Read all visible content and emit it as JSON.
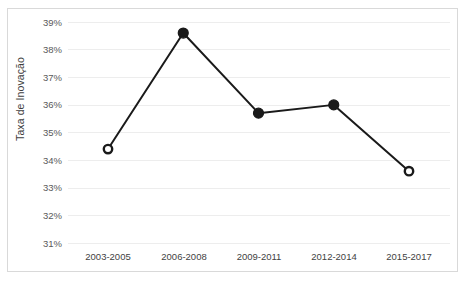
{
  "chart_data": {
    "type": "line",
    "title": "",
    "xlabel": "",
    "ylabel": "Taxa de Inovação",
    "categories": [
      "2003-2005",
      "2006-2008",
      "2009-2011",
      "2012-2014",
      "2015-2017"
    ],
    "values": [
      34.4,
      38.6,
      35.7,
      36.0,
      33.6
    ],
    "value_labels": [
      "34,4%",
      "38,6%",
      "35,7%",
      "36,0%",
      "33,6%"
    ],
    "ylim": [
      31,
      39
    ],
    "ytick_labels": [
      "39%",
      "38%",
      "37%",
      "36%",
      "35%",
      "34%",
      "33%",
      "32%",
      "31%"
    ],
    "ytick_values": [
      39,
      38,
      37,
      36,
      35,
      34,
      33,
      32,
      31
    ],
    "grid": true,
    "legend": "none",
    "marker_styles": [
      "hollow",
      "filled",
      "filled",
      "filled",
      "hollow"
    ],
    "series_color": "#1a1a1a",
    "grid_color": "#ededed",
    "border_color": "#d9d9d9",
    "tick_text_color": "#595959",
    "axis_title_color": "#3f3f3f"
  }
}
